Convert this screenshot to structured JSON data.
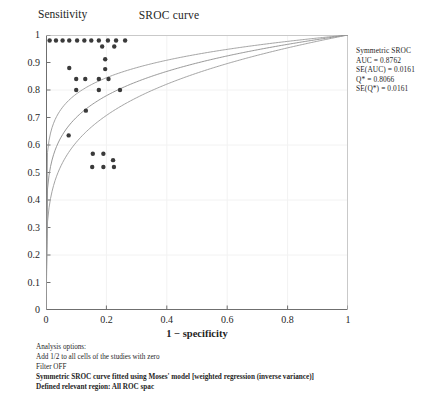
{
  "chart_data": {
    "type": "scatter",
    "title": "SROC curve",
    "xlabel": "1 − specificity",
    "ylabel": "Sensitivity",
    "xlim": [
      0,
      1
    ],
    "ylim": [
      0,
      1
    ],
    "grid": true,
    "xticks": [
      "0",
      "0.2",
      "0.4",
      "0.6",
      "0.8",
      "1"
    ],
    "xtick_values": [
      0,
      0.2,
      0.4,
      0.6,
      0.8,
      1
    ],
    "yticks": [
      "0",
      "0.1",
      "0.2",
      "0.3",
      "0.4",
      "0.5",
      "0.6",
      "0.7",
      "0.8",
      "0.9",
      "1"
    ],
    "ytick_values": [
      0,
      0.1,
      0.2,
      0.3,
      0.4,
      0.5,
      0.6,
      0.7,
      0.8,
      0.9,
      1
    ],
    "legend_position": "right-outside",
    "series": [
      {
        "name": "Study estimates",
        "type": "scatter",
        "marker": "filled-circle",
        "color": "#3a3a3a",
        "points": [
          [
            0.012,
            0.98
          ],
          [
            0.033,
            0.98
          ],
          [
            0.055,
            0.98
          ],
          [
            0.077,
            0.98
          ],
          [
            0.103,
            0.98
          ],
          [
            0.127,
            0.98
          ],
          [
            0.15,
            0.98
          ],
          [
            0.175,
            0.98
          ],
          [
            0.205,
            0.98
          ],
          [
            0.232,
            0.98
          ],
          [
            0.262,
            0.98
          ],
          [
            0.186,
            0.958
          ],
          [
            0.226,
            0.958
          ],
          [
            0.077,
            0.88
          ],
          [
            0.196,
            0.912
          ],
          [
            0.196,
            0.876
          ],
          [
            0.1,
            0.84
          ],
          [
            0.13,
            0.84
          ],
          [
            0.175,
            0.84
          ],
          [
            0.207,
            0.84
          ],
          [
            0.1,
            0.8
          ],
          [
            0.175,
            0.8
          ],
          [
            0.245,
            0.8
          ],
          [
            0.132,
            0.725
          ],
          [
            0.075,
            0.635
          ],
          [
            0.155,
            0.568
          ],
          [
            0.19,
            0.568
          ],
          [
            0.222,
            0.545
          ],
          [
            0.153,
            0.52
          ],
          [
            0.19,
            0.52
          ],
          [
            0.225,
            0.52
          ]
        ]
      },
      {
        "name": "Symmetric SROC curve",
        "type": "line",
        "color": "#8c8c8c",
        "note": "central fitted SROC curve through (0,0) to (1,1)"
      },
      {
        "name": "Confidence band lower",
        "type": "line",
        "color": "#9a9a9a"
      },
      {
        "name": "Confidence band upper",
        "type": "line",
        "color": "#9a9a9a"
      }
    ],
    "annotations": {
      "legend_lines": [
        "Symmetric SROC",
        "AUC = 0.8762",
        "SE(AUC) = 0.0161",
        "Q* = 0.8066",
        "SE(Q*) = 0.0161"
      ],
      "footnotes": [
        {
          "text": "Analysis options:",
          "bold": false
        },
        {
          "text": "Add 1/2 to all cells of the studies with zero",
          "bold": false
        },
        {
          "text": "Filter OFF",
          "bold": false
        },
        {
          "text": "Symmetric SROC curve fitted using Moses' model [weighted regression (inverse variance)]",
          "bold": true
        },
        {
          "text": "Defined relevant region: All ROC spac",
          "bold": true
        }
      ]
    },
    "stats": {
      "model": "Symmetric SROC",
      "AUC": 0.8762,
      "SE_AUC": 0.0161,
      "Q_star": 0.8066,
      "SE_Q_star": 0.0161
    },
    "colors": {
      "point": "#3a3a3a",
      "curve": "#8c8c8c",
      "axis": "#6f6f6f",
      "grid": "#f2f2f2",
      "text": "#1f1f1f",
      "background": "#ffffff"
    }
  }
}
